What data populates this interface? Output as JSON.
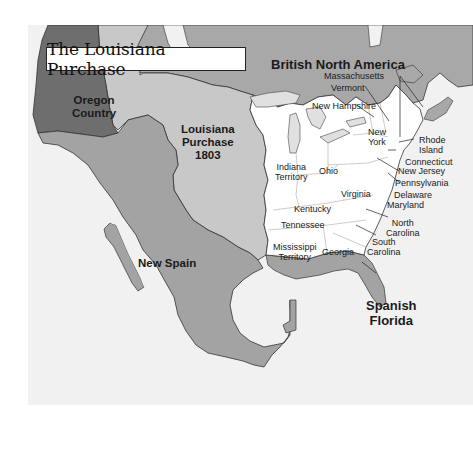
{
  "title": "The Louisiana Purchase",
  "colors": {
    "water": "#f1f1f1",
    "british_north_america": "#a8a8a8",
    "oregon_country": "#6e6e6e",
    "louisiana_purchase": "#c8c8c8",
    "new_spain": "#a3a3a3",
    "united_states": "#ffffff",
    "spanish_florida": "#a3a3a3",
    "border": "#333333"
  },
  "regions": {
    "british_north_america": "British North America",
    "oregon_country": [
      "Oregon",
      "Country"
    ],
    "louisiana_purchase": [
      "Louisiana",
      "Purchase",
      "1803"
    ],
    "new_spain": "New Spain",
    "spanish_florida": [
      "Spanish",
      "Florida"
    ]
  },
  "states": {
    "massachusetts": "Massachusetts",
    "vermont": "Vermont",
    "new_hampshire": "New Hampshire",
    "new_york": [
      "New",
      "York"
    ],
    "rhode_island": [
      "Rhode",
      "Island"
    ],
    "connecticut": "Connecticut",
    "new_jersey": "New Jersey",
    "pennsylvania": "Pennsylvania",
    "delaware": "Delaware",
    "maryland": "Maryland",
    "virginia": "Virginia",
    "north_carolina": [
      "North",
      "Carolina"
    ],
    "south_carolina": [
      "South",
      "Carolina"
    ],
    "georgia": "Georgia",
    "ohio": "Ohio",
    "kentucky": "Kentucky",
    "tennessee": "Tennessee",
    "indiana_territory": [
      "Indiana",
      "Territory"
    ],
    "mississippi_territory": [
      "Mississippi",
      "Territory"
    ]
  }
}
